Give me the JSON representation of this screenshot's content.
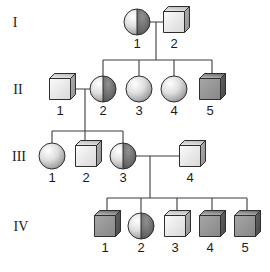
{
  "figure": {
    "type": "pedigree-chart",
    "canvas": {
      "width": 270,
      "height": 272,
      "background": "#ffffff"
    },
    "palette": {
      "outline": "#2e2e2e",
      "line": "#3c3c3c",
      "text": "#1b1b1b",
      "sphere_light": [
        "#ffffff",
        "#dedede",
        "#ababab",
        "#8f8f8f"
      ],
      "sphere_dark": [
        "#919191",
        "#6a6a6a",
        "#4e4e4e"
      ],
      "cube_light_front": [
        "#fbfbfb",
        "#d8d8d8"
      ],
      "cube_light_top": [
        "#ededed",
        "#bfbfbf"
      ],
      "cube_light_right": [
        "#b0b0b0",
        "#8d8d8d"
      ],
      "cube_dark_front": [
        "#a6a6a6",
        "#878787"
      ],
      "cube_dark_top": [
        "#c2c2c2",
        "#747474"
      ],
      "cube_dark_right": [
        "#636363",
        "#474747"
      ]
    },
    "generation_labels": [
      {
        "label": "I",
        "x": 15,
        "y": 22
      },
      {
        "label": "II",
        "x": 18,
        "y": 89
      },
      {
        "label": "III",
        "x": 19,
        "y": 156
      },
      {
        "label": "IV",
        "x": 21,
        "y": 226
      }
    ],
    "members": [
      {
        "id": "I-1",
        "generation": "I",
        "label": "1",
        "shape": "circle",
        "sex": "female",
        "status": "carrier",
        "x": 137,
        "y": 22
      },
      {
        "id": "I-2",
        "generation": "I",
        "label": "2",
        "shape": "square",
        "sex": "male",
        "status": "unaffected",
        "x": 174,
        "y": 22
      },
      {
        "id": "II-1",
        "generation": "II",
        "label": "1",
        "shape": "square",
        "sex": "male",
        "status": "unaffected",
        "x": 60,
        "y": 89
      },
      {
        "id": "II-2",
        "generation": "II",
        "label": "2",
        "shape": "circle",
        "sex": "female",
        "status": "carrier",
        "x": 103,
        "y": 89
      },
      {
        "id": "II-3",
        "generation": "II",
        "label": "3",
        "shape": "circle",
        "sex": "female",
        "status": "unaffected",
        "x": 139,
        "y": 89
      },
      {
        "id": "II-4",
        "generation": "II",
        "label": "4",
        "shape": "circle",
        "sex": "female",
        "status": "unaffected",
        "x": 174,
        "y": 89
      },
      {
        "id": "II-5",
        "generation": "II",
        "label": "5",
        "shape": "square",
        "sex": "male",
        "status": "affected",
        "x": 210,
        "y": 89
      },
      {
        "id": "III-1",
        "generation": "III",
        "label": "1",
        "shape": "circle",
        "sex": "female",
        "status": "unaffected",
        "x": 52,
        "y": 156
      },
      {
        "id": "III-2",
        "generation": "III",
        "label": "2",
        "shape": "square",
        "sex": "male",
        "status": "unaffected",
        "x": 86,
        "y": 156
      },
      {
        "id": "III-3",
        "generation": "III",
        "label": "3",
        "shape": "circle",
        "sex": "female",
        "status": "carrier",
        "x": 123,
        "y": 156
      },
      {
        "id": "III-4",
        "generation": "III",
        "label": "4",
        "shape": "square",
        "sex": "male",
        "status": "unaffected",
        "x": 190,
        "y": 156
      },
      {
        "id": "IV-1",
        "generation": "IV",
        "label": "1",
        "shape": "square",
        "sex": "male",
        "status": "affected",
        "x": 105,
        "y": 226
      },
      {
        "id": "IV-2",
        "generation": "IV",
        "label": "2",
        "shape": "circle",
        "sex": "female",
        "status": "carrier",
        "x": 141,
        "y": 226
      },
      {
        "id": "IV-3",
        "generation": "IV",
        "label": "3",
        "shape": "square",
        "sex": "male",
        "status": "unaffected",
        "x": 175,
        "y": 226
      },
      {
        "id": "IV-4",
        "generation": "IV",
        "label": "4",
        "shape": "square",
        "sex": "male",
        "status": "affected",
        "x": 210,
        "y": 226
      },
      {
        "id": "IV-5",
        "generation": "IV",
        "label": "5",
        "shape": "square",
        "sex": "male",
        "status": "affected",
        "x": 245,
        "y": 226
      }
    ],
    "connectors": [
      {
        "x1": 137,
        "y1": 22,
        "x2": 174,
        "y2": 22
      },
      {
        "x1": 156,
        "y1": 22,
        "x2": 156,
        "y2": 60
      },
      {
        "x1": 103,
        "y1": 60,
        "x2": 212,
        "y2": 60
      },
      {
        "x1": 103,
        "y1": 60,
        "x2": 103,
        "y2": 89
      },
      {
        "x1": 139,
        "y1": 60,
        "x2": 139,
        "y2": 89
      },
      {
        "x1": 174,
        "y1": 60,
        "x2": 174,
        "y2": 89
      },
      {
        "x1": 212,
        "y1": 60,
        "x2": 212,
        "y2": 89
      },
      {
        "x1": 60,
        "y1": 89,
        "x2": 103,
        "y2": 89
      },
      {
        "x1": 85,
        "y1": 89,
        "x2": 85,
        "y2": 131
      },
      {
        "x1": 52,
        "y1": 131,
        "x2": 123,
        "y2": 131
      },
      {
        "x1": 52,
        "y1": 131,
        "x2": 52,
        "y2": 156
      },
      {
        "x1": 85,
        "y1": 131,
        "x2": 85,
        "y2": 156
      },
      {
        "x1": 123,
        "y1": 131,
        "x2": 123,
        "y2": 156
      },
      {
        "x1": 123,
        "y1": 156,
        "x2": 190,
        "y2": 156
      },
      {
        "x1": 150,
        "y1": 156,
        "x2": 150,
        "y2": 198
      },
      {
        "x1": 107,
        "y1": 198,
        "x2": 247,
        "y2": 198
      },
      {
        "x1": 107,
        "y1": 198,
        "x2": 107,
        "y2": 226
      },
      {
        "x1": 141,
        "y1": 198,
        "x2": 141,
        "y2": 226
      },
      {
        "x1": 177,
        "y1": 198,
        "x2": 177,
        "y2": 226
      },
      {
        "x1": 212,
        "y1": 198,
        "x2": 212,
        "y2": 226
      },
      {
        "x1": 247,
        "y1": 198,
        "x2": 247,
        "y2": 226
      }
    ]
  }
}
